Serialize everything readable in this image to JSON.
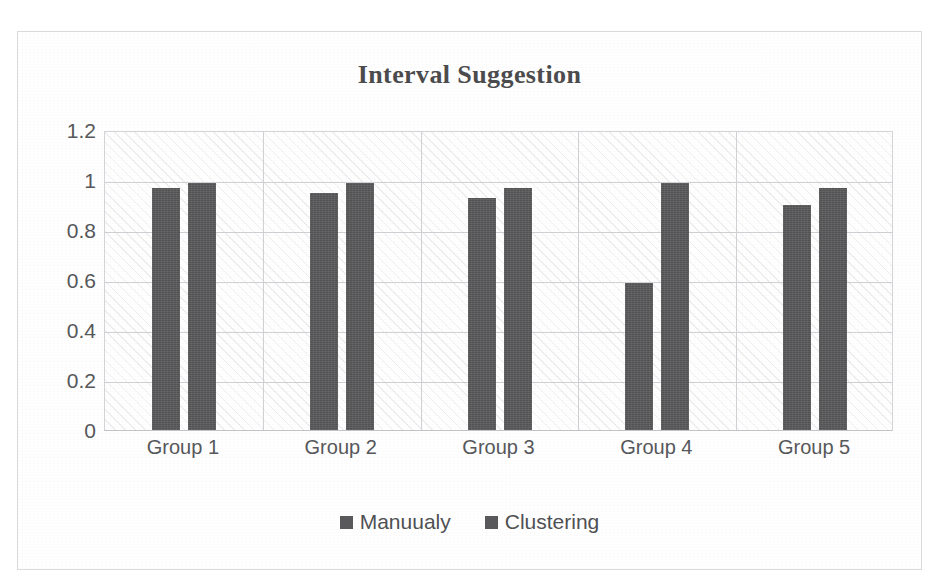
{
  "chart_data": {
    "type": "bar",
    "title": "Interval Suggestion",
    "xlabel": "",
    "ylabel": "",
    "categories": [
      "Group 1",
      "Group 2",
      "Group 3",
      "Group 4",
      "Group 5"
    ],
    "series": [
      {
        "name": "Manuualy",
        "values": [
          0.97,
          0.95,
          0.93,
          0.59,
          0.9
        ]
      },
      {
        "name": "Clustering",
        "values": [
          0.99,
          0.99,
          0.97,
          0.99,
          0.97
        ]
      }
    ],
    "ylim": [
      0,
      1.2
    ],
    "ytick_labels": [
      "0",
      "0.2",
      "0.4",
      "0.6",
      "0.8",
      "1",
      "1.2"
    ],
    "ytick_values": [
      0,
      0.2,
      0.4,
      0.6,
      0.8,
      1,
      1.2
    ],
    "grid": true,
    "legend_position": "bottom",
    "bar_color": "#59595b",
    "plot_border_color": "#d2d4d8",
    "gridline_color": "#cfd1d5",
    "title_color": "#4b4b4d",
    "tick_label_color": "#56575a"
  }
}
